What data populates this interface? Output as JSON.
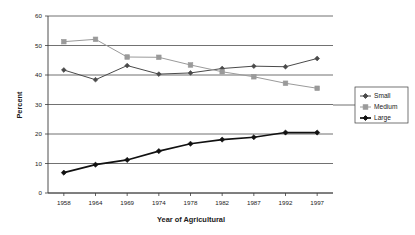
{
  "chart_data": {
    "type": "line",
    "title": "",
    "xlabel": "Year of Agricultural",
    "ylabel": "Percent",
    "categories": [
      "1958",
      "1964",
      "1969",
      "1974",
      "1978",
      "1982",
      "1987",
      "1992",
      "1997"
    ],
    "ylim": [
      0,
      60
    ],
    "yticks": [
      "0",
      "10",
      "20",
      "30",
      "40",
      "50",
      "60"
    ],
    "ytick_values": [
      0,
      10,
      20,
      30,
      40,
      50,
      60
    ],
    "grid": "horizontal",
    "legend_position": "right",
    "series": [
      {
        "name": "Small",
        "color": "#4a4a4a",
        "marker": "diamond",
        "values": [
          41.7,
          38.4,
          43.2,
          40.3,
          40.7,
          42.2,
          43.0,
          42.8,
          45.6
        ]
      },
      {
        "name": "Medium",
        "color": "#9a9a9a",
        "marker": "square",
        "values": [
          51.3,
          52.1,
          46.1,
          46.0,
          43.4,
          41.1,
          39.4,
          37.2,
          35.5
        ]
      },
      {
        "name": "Large",
        "color": "#111111",
        "marker": "diamond",
        "values": [
          6.9,
          9.6,
          11.2,
          14.2,
          16.7,
          18.1,
          18.9,
          20.5,
          20.5
        ]
      }
    ]
  },
  "legend": {
    "items": [
      {
        "label": "Small"
      },
      {
        "label": "Medium"
      },
      {
        "label": "Large"
      }
    ]
  },
  "axes": {
    "y_title": "Percent",
    "x_title": "Year of Agricultural"
  }
}
